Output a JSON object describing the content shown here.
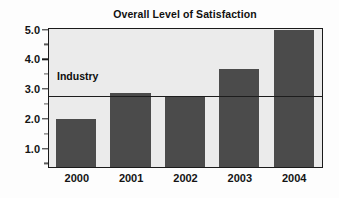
{
  "chart_data": {
    "type": "bar",
    "title": "Overall Level of Satisfaction",
    "xlabel": "",
    "ylabel": "",
    "categories": [
      "2000",
      "2001",
      "2002",
      "2003",
      "2004"
    ],
    "values": [
      2.0,
      2.9,
      2.75,
      3.7,
      5.0
    ],
    "series": [
      {
        "name": "Overall Level of Satisfaction",
        "values": [
          2.0,
          2.9,
          2.75,
          3.7,
          5.0
        ],
        "color": "#4b4b4b"
      }
    ],
    "ylim": [
      0.4,
      5.0
    ],
    "y_major_ticks": [
      1.0,
      2.0,
      3.0,
      4.0,
      5.0
    ],
    "y_major_tick_labels": [
      "1.0",
      "2.0",
      "3.0",
      "4.0",
      "5.0"
    ],
    "y_minor_ticks": [
      0.5,
      1.5,
      2.5,
      3.5,
      4.5
    ],
    "grid": false,
    "legend": "none",
    "annotations": [
      {
        "label": "Industry",
        "type": "reference-line",
        "value": 2.75,
        "orientation": "horizontal",
        "color": "#1d1d1d"
      }
    ],
    "plot_background": "#ebebeb",
    "figure_background": "#fdfdfd",
    "axis_color": "#1a1a1a"
  },
  "chart": {
    "title": "Overall Level of Satisfaction",
    "industry_label": "Industry"
  }
}
